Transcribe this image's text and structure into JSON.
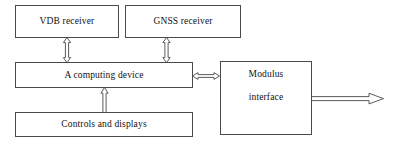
{
  "diagram": {
    "type": "block-diagram",
    "background_color": "#ffffff",
    "line_color": "#4a4a4a",
    "text_color": "#111111",
    "nodes": [
      {
        "id": "vdb-receiver",
        "label": "VDB receiver",
        "x": 15,
        "y": 5,
        "w": 104,
        "h": 33
      },
      {
        "id": "gnss-receiver",
        "label": "GNSS receiver",
        "x": 125,
        "y": 5,
        "w": 116,
        "h": 33
      },
      {
        "id": "computing-device",
        "label": "A computing device",
        "x": 15,
        "y": 62,
        "w": 178,
        "h": 26
      },
      {
        "id": "controls-displays",
        "label": "Controls and displays",
        "x": 15,
        "y": 112,
        "w": 178,
        "h": 25
      },
      {
        "id": "modulus-interface",
        "label_line1": "Modulus",
        "label_line2": "interface",
        "x": 220,
        "y": 61,
        "w": 92,
        "h": 74
      }
    ],
    "connectors": [
      {
        "id": "vdb-to-computing",
        "from": "vdb-receiver",
        "to": "computing-device",
        "style": "block-arrow",
        "orientation": "vertical",
        "heads": "both"
      },
      {
        "id": "gnss-to-computing",
        "from": "gnss-receiver",
        "to": "computing-device",
        "style": "block-arrow",
        "orientation": "vertical",
        "heads": "both"
      },
      {
        "id": "controls-to-computing",
        "from": "controls-displays",
        "to": "computing-device",
        "style": "block-arrow",
        "orientation": "vertical",
        "heads": "up"
      },
      {
        "id": "computing-to-modulus",
        "from": "computing-device",
        "to": "modulus-interface",
        "style": "block-arrow",
        "orientation": "horizontal",
        "heads": "both"
      },
      {
        "id": "modulus-output",
        "from": "modulus-interface",
        "to": "external-output",
        "style": "block-arrow",
        "orientation": "horizontal",
        "heads": "right"
      }
    ]
  }
}
